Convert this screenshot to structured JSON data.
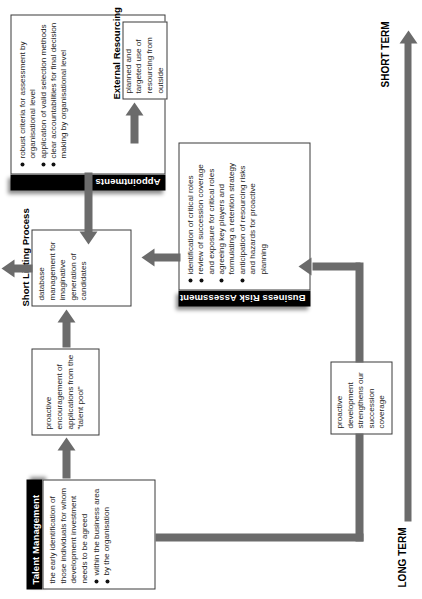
{
  "diagram": {
    "orientation_note": "rotated 90 degrees counter-clockwise",
    "colors": {
      "header_bg": "#000000",
      "header_text": "#ffffff",
      "box_border": "#3a3a3a",
      "arrow": "#6b6b6b",
      "background": "#ffffff"
    }
  },
  "nodes": {
    "talent_management": {
      "title": "Talent Management",
      "body": "the early identification of those individuals for whom development investment needs to be agreed",
      "bullets": [
        "within the business area",
        "by the organisation"
      ]
    },
    "proactive_encouragement": {
      "text": "proactive encouragement of applications from the \"talent pool\""
    },
    "short_listing_process": {
      "title": "Short Listing Process",
      "body": "database management for imaginative generation of candidates"
    },
    "appointments": {
      "title": "Appointments",
      "bullets": [
        "robust criteria for assessment by organisational level",
        "application of valid selection methods",
        "clear accountabilities for final decision making by organisational level"
      ]
    },
    "business_risk_assessment": {
      "title": "Business Risk Assessment",
      "bullets": [
        "identification of critical roles",
        "review of succession coverage and exposure for critical roles",
        "agreeing key players and formulating a retention strategy",
        "anticipation of resourcing risks and hazards for proactive planning"
      ]
    },
    "external_resourcing": {
      "title": "External Resourcing",
      "body": "planned and targeted use of resourcing from outside"
    },
    "proactive_development": {
      "text": "proactive development strengthens our succession coverage"
    }
  },
  "timeline": {
    "start_label": "LONG TERM",
    "end_label": "SHORT TERM"
  }
}
